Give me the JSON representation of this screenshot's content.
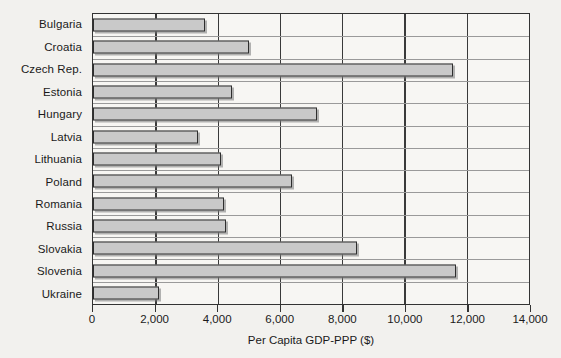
{
  "chart_data": {
    "type": "bar",
    "orientation": "horizontal",
    "title": "",
    "xlabel": "Per Capita GDP-PPP ($)",
    "ylabel": "",
    "xlim": [
      0,
      14000
    ],
    "xticks": [
      0,
      2000,
      4000,
      6000,
      8000,
      10000,
      12000,
      14000
    ],
    "xticklabels": [
      "0",
      "2,000",
      "4,000",
      "6,000",
      "8,000",
      "10,000",
      "12,000",
      "14,000"
    ],
    "grid": "vertical",
    "legend": "none",
    "bar_color": "#c9c9c9",
    "bar_edge_color": "#2e2e2e",
    "categories": [
      "Bulgaria",
      "Croatia",
      "Czech Rep.",
      "Estonia",
      "Hungary",
      "Latvia",
      "Lithuania",
      "Poland",
      "Romania",
      "Russia",
      "Slovakia",
      "Slovenia",
      "Ukraine"
    ],
    "values": [
      3600,
      5000,
      11550,
      4470,
      7200,
      3375,
      4125,
      6400,
      4200,
      4280,
      8470,
      11650,
      2125
    ]
  }
}
